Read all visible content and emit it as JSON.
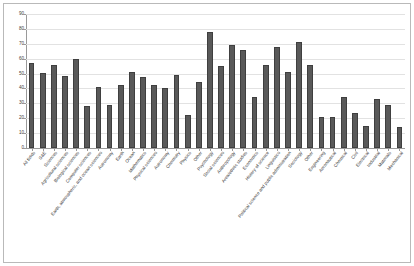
{
  "chart_data": {
    "type": "bar",
    "title": "",
    "subtitle": "",
    "xlabel": "",
    "ylabel": "",
    "ylim": [
      0,
      90
    ],
    "ytick_values": [
      0,
      10,
      20,
      30,
      40,
      50,
      60,
      70,
      80,
      90
    ],
    "ytick_labels": [
      "0",
      "10",
      "20",
      "30",
      "40",
      "50",
      "60",
      "70",
      "80",
      "90"
    ],
    "grid": true,
    "legend": false,
    "legend_position": "none",
    "bar_color": "#595959",
    "bar_edge_color": "#3f3f3f",
    "gridline_color": "#e2e2e2",
    "axis_color": "#9a9a9a",
    "frame_color": "#b9b9b9",
    "background_color": "#ffffff",
    "categories": [
      "All fields",
      "S&E",
      "Sciences",
      "Agricultural sciences",
      "Biological sciences",
      "Computer sciences",
      "Earth, atmospheric, and ocean sciences",
      "Astronomy",
      "Earth",
      "Ocean",
      "Mathematics",
      "Physical sciences",
      "Astronomy",
      "Chemistry",
      "Physics",
      "Other",
      "Psychology",
      "Social sciences",
      "Anthropology",
      "Area/ethnic studies",
      "Economics",
      "History of science",
      "Linguistics",
      "Political science and public administration",
      "Sociology",
      "Other",
      "Engineering",
      "Aeronautical",
      "Chemical",
      "Civil",
      "Electrical",
      "Industrial",
      "Materials",
      "Mechanical"
    ],
    "values": [
      57.0,
      50.5,
      56.0,
      48.5,
      59.5,
      28.0,
      41.0,
      29.0,
      42.0,
      51.0,
      48.0,
      42.0,
      40.0,
      49.0,
      22.0,
      44.5,
      78.0,
      55.0,
      69.0,
      66.0,
      34.5,
      56.0,
      68.0,
      51.0,
      71.0,
      55.5,
      21.0,
      21.0,
      34.0,
      23.5,
      15.0,
      33.0,
      29.0,
      14.0
    ]
  }
}
